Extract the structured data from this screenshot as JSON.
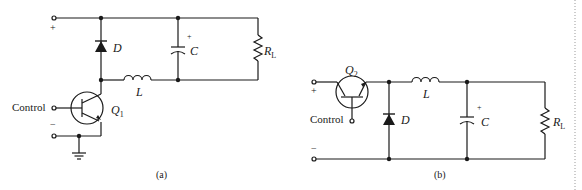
{
  "figure": {
    "a": {
      "caption": "(a)",
      "terminal_plus": "+",
      "terminal_minus": "−",
      "control_label": "Control",
      "diode_label": "D",
      "capacitor_label": "C",
      "capacitor_polarity": "+",
      "inductor_label": "L",
      "resistor_label": "R",
      "resistor_sub": "L",
      "transistor_label": "Q",
      "transistor_sub": "1"
    },
    "b": {
      "caption": "(b)",
      "terminal_plus": "+",
      "terminal_minus": "−",
      "control_label": "Control",
      "diode_label": "D",
      "capacitor_label": "C",
      "capacitor_polarity": "+",
      "inductor_label": "L",
      "resistor_label": "R",
      "resistor_sub": "L",
      "transistor_label": "Q",
      "transistor_sub": "2"
    }
  },
  "colors": {
    "ink": "#1a1a1a",
    "divider": "#9a9a9a"
  }
}
